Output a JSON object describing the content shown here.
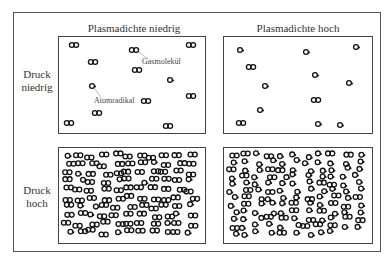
{
  "diagram": {
    "columns": [
      {
        "title": "Plasmadichte niedrig"
      },
      {
        "title": "Plasmadichte hoch"
      }
    ],
    "rows": [
      {
        "label_line1": "Druck",
        "label_line2": "niedrig"
      },
      {
        "label_line1": "Druck",
        "label_line2": "hoch"
      }
    ],
    "annotations": {
      "molecule": "Gasmolekül",
      "radical": "Atomradikal"
    },
    "legend": {
      "molecule_icon": "double-ring (two linked circles)",
      "radical_icon": "single ring with dot"
    },
    "panels": {
      "low_pressure_low_density": {
        "molecules": [
          [
            74,
            45
          ],
          [
            93,
            62
          ],
          [
            134,
            50
          ],
          [
            137,
            70
          ],
          [
            191,
            45
          ],
          [
            191,
            96
          ],
          [
            146,
            101
          ],
          [
            97,
            113
          ],
          [
            69,
            123
          ],
          [
            168,
            126
          ]
        ],
        "radicals": [
          [
            92,
            86
          ],
          [
            170,
            80
          ]
        ]
      },
      "low_pressure_high_density": {
        "molecules": [
          [
            251,
            67
          ],
          [
            316,
            100
          ],
          [
            241,
            123
          ]
        ],
        "radicals": [
          [
            240,
            50
          ],
          [
            306,
            52
          ],
          [
            356,
            47
          ],
          [
            315,
            75
          ],
          [
            349,
            83
          ],
          [
            265,
            86
          ],
          [
            260,
            110
          ],
          [
            318,
            124
          ],
          [
            340,
            125
          ]
        ]
      }
    }
  }
}
